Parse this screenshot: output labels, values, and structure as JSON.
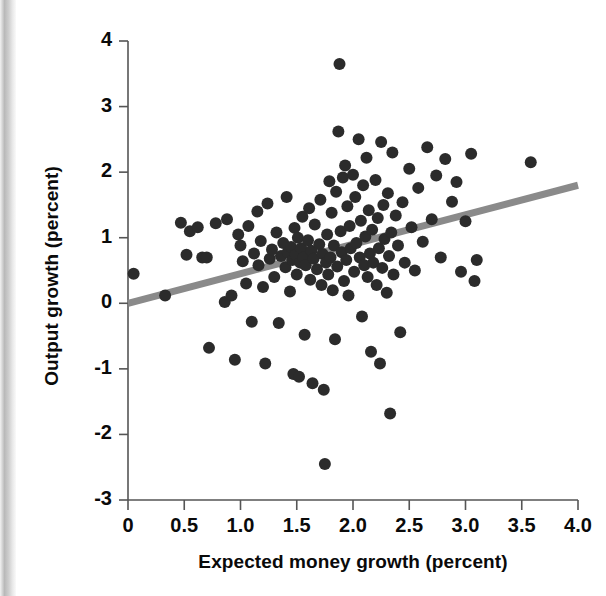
{
  "figure": {
    "background": "#ffffff",
    "scan_edge_color": "#b9b9b9"
  },
  "chart_data": {
    "type": "scatter",
    "title": "",
    "xlabel": "Expected money growth (percent)",
    "ylabel": "Output growth (percent)",
    "xlim": [
      0,
      4.0
    ],
    "ylim": [
      -3,
      4
    ],
    "xticks": [
      0,
      0.5,
      1.0,
      1.5,
      2.0,
      2.5,
      3.0,
      3.5,
      4.0
    ],
    "xtick_labels": [
      "0",
      "0.5",
      "1.0",
      "1.5",
      "2.0",
      "2.5",
      "3.0",
      "3.5",
      "4.0"
    ],
    "yticks": [
      -3,
      -2,
      -1,
      0,
      1,
      2,
      3,
      4
    ],
    "ytick_labels": [
      "-3",
      "-2",
      "-1",
      "0",
      "1",
      "2",
      "3",
      "4"
    ],
    "grid": false,
    "legend": null,
    "marker_color": "#2b2b2b",
    "marker_size": 12,
    "trendline": {
      "name": "fitted regression line",
      "color": "#8a8a8a",
      "width": 7,
      "x": [
        0.0,
        4.0
      ],
      "y": [
        0.0,
        1.8
      ]
    },
    "series": [
      {
        "name": "observations",
        "points": [
          [
            0.05,
            0.45
          ],
          [
            0.33,
            0.12
          ],
          [
            0.47,
            1.23
          ],
          [
            0.52,
            0.74
          ],
          [
            0.55,
            1.1
          ],
          [
            0.62,
            1.16
          ],
          [
            0.66,
            0.7
          ],
          [
            0.7,
            0.7
          ],
          [
            0.72,
            -0.68
          ],
          [
            0.78,
            1.22
          ],
          [
            0.86,
            0.02
          ],
          [
            0.88,
            1.28
          ],
          [
            0.92,
            0.12
          ],
          [
            0.95,
            -0.86
          ],
          [
            0.98,
            1.05
          ],
          [
            1.0,
            0.88
          ],
          [
            1.02,
            0.64
          ],
          [
            1.05,
            0.3
          ],
          [
            1.07,
            1.18
          ],
          [
            1.1,
            -0.28
          ],
          [
            1.12,
            0.76
          ],
          [
            1.15,
            1.4
          ],
          [
            1.16,
            0.58
          ],
          [
            1.18,
            0.95
          ],
          [
            1.2,
            0.25
          ],
          [
            1.22,
            -0.92
          ],
          [
            1.24,
            1.52
          ],
          [
            1.26,
            0.68
          ],
          [
            1.28,
            0.82
          ],
          [
            1.3,
            0.4
          ],
          [
            1.32,
            1.08
          ],
          [
            1.34,
            -0.3
          ],
          [
            1.36,
            0.72
          ],
          [
            1.38,
            0.92
          ],
          [
            1.4,
            0.55
          ],
          [
            1.41,
            1.62
          ],
          [
            1.42,
            0.78
          ],
          [
            1.44,
            0.18
          ],
          [
            1.45,
            0.86
          ],
          [
            1.46,
            0.66
          ],
          [
            1.47,
            -1.08
          ],
          [
            1.48,
            1.15
          ],
          [
            1.49,
            0.74
          ],
          [
            1.5,
            0.44
          ],
          [
            1.51,
            1.0
          ],
          [
            1.52,
            -1.12
          ],
          [
            1.53,
            0.62
          ],
          [
            1.54,
            0.84
          ],
          [
            1.55,
            1.32
          ],
          [
            1.56,
            0.7
          ],
          [
            1.57,
            -0.48
          ],
          [
            1.58,
            0.58
          ],
          [
            1.6,
            0.96
          ],
          [
            1.61,
            1.45
          ],
          [
            1.62,
            0.36
          ],
          [
            1.63,
            0.8
          ],
          [
            1.64,
            -1.22
          ],
          [
            1.65,
            0.68
          ],
          [
            1.66,
            1.2
          ],
          [
            1.68,
            0.52
          ],
          [
            1.7,
            0.9
          ],
          [
            1.71,
            1.58
          ],
          [
            1.72,
            0.28
          ],
          [
            1.73,
            0.75
          ],
          [
            1.74,
            -1.32
          ],
          [
            1.75,
            -2.45
          ],
          [
            1.76,
            0.62
          ],
          [
            1.77,
            1.05
          ],
          [
            1.78,
            0.44
          ],
          [
            1.79,
            1.86
          ],
          [
            1.8,
            0.7
          ],
          [
            1.81,
            1.38
          ],
          [
            1.82,
            0.2
          ],
          [
            1.83,
            0.88
          ],
          [
            1.84,
            -0.55
          ],
          [
            1.85,
            1.7
          ],
          [
            1.86,
            0.56
          ],
          [
            1.87,
            2.62
          ],
          [
            1.88,
            3.65
          ],
          [
            1.89,
            1.1
          ],
          [
            1.9,
            0.78
          ],
          [
            1.91,
            1.92
          ],
          [
            1.92,
            0.34
          ],
          [
            1.93,
            2.1
          ],
          [
            1.94,
            0.66
          ],
          [
            1.95,
            1.48
          ],
          [
            1.96,
            0.12
          ],
          [
            1.97,
            1.18
          ],
          [
            1.98,
            0.84
          ],
          [
            2.0,
            1.96
          ],
          [
            2.01,
            0.48
          ],
          [
            2.02,
            1.62
          ],
          [
            2.03,
            0.92
          ],
          [
            2.05,
            2.5
          ],
          [
            2.06,
            0.7
          ],
          [
            2.07,
            1.26
          ],
          [
            2.08,
            -0.2
          ],
          [
            2.09,
            1.8
          ],
          [
            2.1,
            0.58
          ],
          [
            2.11,
            1.02
          ],
          [
            2.12,
            2.22
          ],
          [
            2.13,
            0.4
          ],
          [
            2.14,
            1.42
          ],
          [
            2.15,
            0.76
          ],
          [
            2.16,
            -0.74
          ],
          [
            2.17,
            1.12
          ],
          [
            2.18,
            0.62
          ],
          [
            2.2,
            1.88
          ],
          [
            2.21,
            0.28
          ],
          [
            2.22,
            1.3
          ],
          [
            2.23,
            0.84
          ],
          [
            2.24,
            -0.92
          ],
          [
            2.25,
            2.46
          ],
          [
            2.26,
            0.54
          ],
          [
            2.27,
            1.5
          ],
          [
            2.28,
            0.98
          ],
          [
            2.3,
            0.16
          ],
          [
            2.31,
            1.68
          ],
          [
            2.32,
            0.72
          ],
          [
            2.33,
            -1.68
          ],
          [
            2.34,
            1.08
          ],
          [
            2.35,
            2.3
          ],
          [
            2.36,
            0.44
          ],
          [
            2.38,
            1.34
          ],
          [
            2.4,
            0.88
          ],
          [
            2.42,
            -0.44
          ],
          [
            2.44,
            1.54
          ],
          [
            2.46,
            0.62
          ],
          [
            2.5,
            2.05
          ],
          [
            2.52,
            1.16
          ],
          [
            2.55,
            0.5
          ],
          [
            2.58,
            1.76
          ],
          [
            2.62,
            0.94
          ],
          [
            2.66,
            2.38
          ],
          [
            2.7,
            1.28
          ],
          [
            2.74,
            1.95
          ],
          [
            2.78,
            0.7
          ],
          [
            2.82,
            2.2
          ],
          [
            2.88,
            1.55
          ],
          [
            2.92,
            1.85
          ],
          [
            2.96,
            0.48
          ],
          [
            3.0,
            1.25
          ],
          [
            3.05,
            2.28
          ],
          [
            3.08,
            0.34
          ],
          [
            3.1,
            0.66
          ],
          [
            3.58,
            2.15
          ]
        ]
      }
    ]
  }
}
